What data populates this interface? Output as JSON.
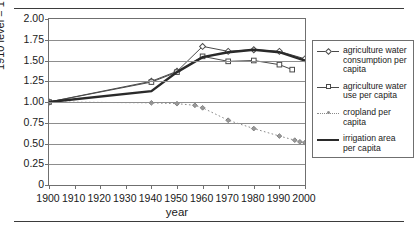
{
  "chart_data": {
    "type": "line",
    "title": "",
    "xlabel": "year",
    "ylabel": "1910 level = 1",
    "xlim": [
      1900,
      2000
    ],
    "ylim": [
      0,
      2.0
    ],
    "grid": true,
    "legend_position": "right",
    "xticks": [
      "1900",
      "1910",
      "1920",
      "1930",
      "1940",
      "1950",
      "1960",
      "1970",
      "1980",
      "1990",
      "2000"
    ],
    "yticks": [
      "0",
      "0.25",
      "0.50",
      "0.75",
      "1.00",
      "1.25",
      "1.50",
      "1.75",
      "2.00"
    ],
    "series": [
      {
        "name": "agriculture water consumption per capita",
        "marker": "diamond",
        "style": "thin-solid",
        "color": "#4a4a4a",
        "x": [
          1900,
          1940,
          1950,
          1960,
          1970,
          1980,
          1990,
          2000
        ],
        "values": [
          1.0,
          1.25,
          1.37,
          1.67,
          1.61,
          1.63,
          1.61,
          1.52
        ]
      },
      {
        "name": "agriculture water use per capita",
        "marker": "square",
        "style": "thin-solid",
        "color": "#4a4a4a",
        "x": [
          1900,
          1940,
          1950,
          1960,
          1970,
          1980,
          1990,
          1995
        ],
        "values": [
          1.0,
          1.24,
          1.36,
          1.55,
          1.49,
          1.5,
          1.45,
          1.39
        ]
      },
      {
        "name": "cropland per capita",
        "marker": "small-diamond",
        "style": "dotted",
        "color": "#8a8a8a",
        "x": [
          1900,
          1940,
          1950,
          1957,
          1960,
          1970,
          1980,
          1990,
          1996,
          1998,
          2000
        ],
        "values": [
          1.0,
          0.99,
          0.98,
          0.96,
          0.93,
          0.78,
          0.68,
          0.59,
          0.54,
          0.52,
          0.51
        ]
      },
      {
        "name": "irrigation area per capita",
        "marker": "none",
        "style": "thick-solid",
        "color": "#2a2a2a",
        "x": [
          1900,
          1940,
          1950,
          1960,
          1970,
          1980,
          1990,
          2000
        ],
        "values": [
          1.0,
          1.13,
          1.36,
          1.54,
          1.6,
          1.63,
          1.6,
          1.5
        ]
      }
    ]
  },
  "legend": {
    "items": [
      {
        "label": "agriculture water consumption per capita",
        "key": "line-diamond"
      },
      {
        "label": "agriculture water use per capita",
        "key": "line-square"
      },
      {
        "label": "cropland per capita",
        "key": "dot"
      },
      {
        "label": "irrigation area per capita",
        "key": "thick-line"
      }
    ]
  },
  "axis": {
    "x_title": "year",
    "y_title": "1910 level = 1"
  }
}
